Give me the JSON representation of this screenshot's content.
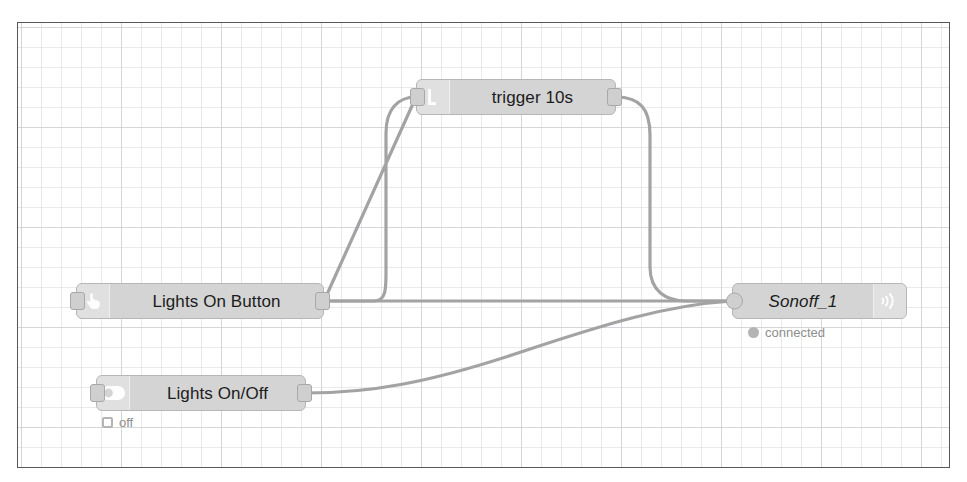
{
  "editor": {
    "name": "node-red-flow-canvas",
    "background_color": "#ffffff",
    "grid_color": "#cdd0d6",
    "border_color": "#58585a",
    "wire_color": "#a3a3a3",
    "node_fill": "#d4d4d4",
    "node_border": "#b6b6b6",
    "text_color": "#1c1c1c",
    "status_text_color": "#8d8d8d"
  },
  "nodes": [
    {
      "id": "trigger",
      "label": "trigger 10s",
      "icon": "trigger-icon",
      "icon_side": "left",
      "italic": false,
      "has_input": true,
      "has_output": true,
      "status": null
    },
    {
      "id": "lights-on-button",
      "label": "Lights On Button",
      "icon": "hand-pointer-icon",
      "icon_side": "left",
      "italic": false,
      "has_input": true,
      "has_output": true,
      "status": null
    },
    {
      "id": "lights-on-off",
      "label": "Lights On/Off",
      "icon": "toggle-switch-icon",
      "icon_side": "left",
      "italic": false,
      "has_input": true,
      "has_output": true,
      "status": {
        "text": "off",
        "shape": "ring"
      }
    },
    {
      "id": "sonoff-1",
      "label": "Sonoff_1",
      "icon": "wifi-broadcast-icon",
      "icon_side": "right",
      "italic": true,
      "has_input": true,
      "has_output": false,
      "status": {
        "text": "connected",
        "shape": "dot"
      }
    }
  ],
  "wires": [
    {
      "id": "button-to-trigger",
      "from": "lights-on-button",
      "to": "trigger"
    },
    {
      "id": "trigger-to-sonoff",
      "from": "trigger",
      "to": "sonoff-1"
    },
    {
      "id": "button-to-sonoff",
      "from": "lights-on-button",
      "to": "sonoff-1"
    },
    {
      "id": "onoff-to-sonoff",
      "from": "lights-on-off",
      "to": "sonoff-1"
    }
  ]
}
